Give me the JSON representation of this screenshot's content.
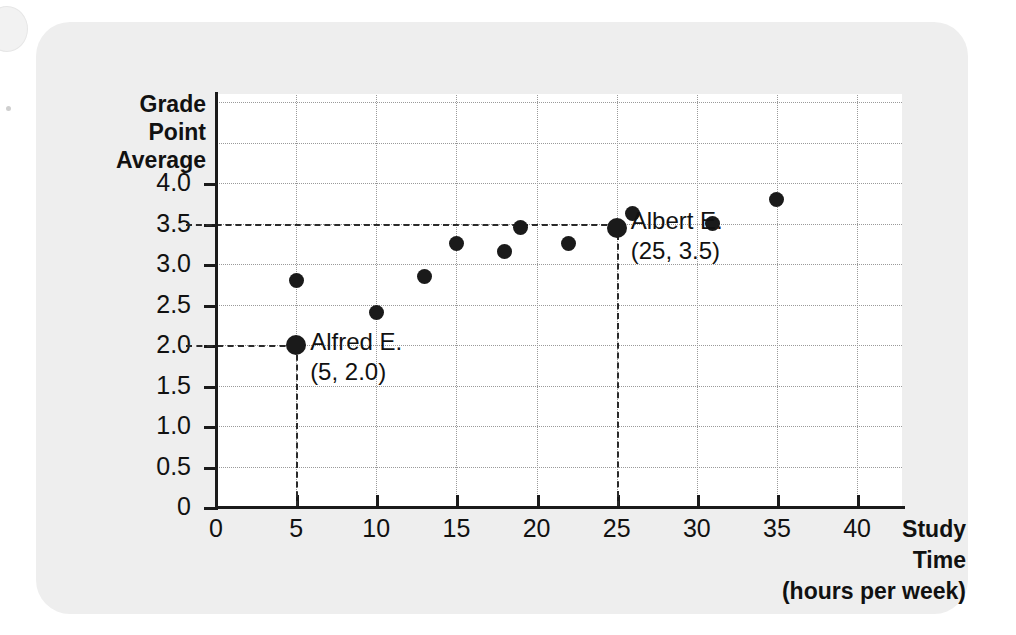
{
  "figure": {
    "card_color": "#eeeeee",
    "plot_background": "#ffffff",
    "ink_color": "#1a1a1a"
  },
  "chart_data": {
    "type": "scatter",
    "title": "",
    "xlabel": "Study Time (hours per week)",
    "xlabel_lines": [
      "Study",
      "Time",
      "(hours per week)"
    ],
    "ylabel": "Grade Point Average",
    "ylabel_lines": [
      "Grade",
      "Point",
      "Average"
    ],
    "xlim": [
      0,
      42.8
    ],
    "ylim": [
      0,
      5.1
    ],
    "grid": true,
    "legend": "none",
    "xticks": [
      0,
      5,
      10,
      15,
      20,
      25,
      30,
      35,
      40
    ],
    "xticklabels": [
      "0",
      "5",
      "10",
      "15",
      "20",
      "25",
      "30",
      "35",
      "40"
    ],
    "yticks": [
      0,
      0.5,
      1.0,
      1.5,
      2.0,
      2.5,
      3.0,
      3.5,
      4.0
    ],
    "yticklabels": [
      "0",
      "0.5",
      "1.0",
      "1.5",
      "2.0",
      "2.5",
      "3.0",
      "3.5",
      "4.0"
    ],
    "ygridlines": [
      0.5,
      1.0,
      1.5,
      2.0,
      2.5,
      3.0,
      3.5,
      4.0,
      4.5,
      5.0
    ],
    "points": [
      {
        "x": 5,
        "y": 2.8,
        "highlight": false
      },
      {
        "x": 5,
        "y": 2.0,
        "highlight": true
      },
      {
        "x": 10,
        "y": 2.4,
        "highlight": false
      },
      {
        "x": 13,
        "y": 2.85,
        "highlight": false
      },
      {
        "x": 15,
        "y": 3.25,
        "highlight": false
      },
      {
        "x": 18,
        "y": 3.15,
        "highlight": false
      },
      {
        "x": 19,
        "y": 3.45,
        "highlight": false
      },
      {
        "x": 22,
        "y": 3.25,
        "highlight": false
      },
      {
        "x": 25,
        "y": 3.45,
        "highlight": true
      },
      {
        "x": 26,
        "y": 3.62,
        "highlight": false
      },
      {
        "x": 31,
        "y": 3.5,
        "highlight": false
      },
      {
        "x": 35,
        "y": 3.8,
        "highlight": false
      }
    ],
    "annotations": [
      {
        "name": "alfred",
        "line1": "Alfred E.",
        "line2": "(5, 2.0)",
        "point": {
          "x": 5,
          "y": 2.0
        },
        "guide_x": 5,
        "guide_y": 2.0
      },
      {
        "name": "albert",
        "line1": "Albert E.",
        "line2": "(25, 3.5)",
        "point": {
          "x": 25,
          "y": 3.5
        },
        "guide_x": 25,
        "guide_y": 3.5
      }
    ]
  }
}
